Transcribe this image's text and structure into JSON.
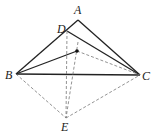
{
  "diagram": {
    "type": "geometry",
    "points": {
      "A": {
        "label": "A",
        "x": 78,
        "y": 20,
        "lx": 74,
        "ly": 14
      },
      "D": {
        "label": "D",
        "x": 67,
        "y": 31,
        "lx": 57,
        "ly": 33
      },
      "I": {
        "label": "",
        "x": 77,
        "y": 51
      },
      "B": {
        "label": "B",
        "x": 16,
        "y": 74,
        "lx": 5,
        "ly": 79
      },
      "C": {
        "label": "C",
        "x": 140,
        "y": 75,
        "lx": 142,
        "ly": 80
      },
      "E": {
        "label": "E",
        "x": 66,
        "y": 118,
        "lx": 61,
        "ly": 131
      }
    },
    "solid_segments": [
      [
        "B",
        "A"
      ],
      [
        "A",
        "C"
      ],
      [
        "D",
        "C"
      ],
      [
        "B",
        "C"
      ],
      [
        "B",
        "I"
      ]
    ],
    "dashed_segments": [
      [
        "I",
        "C"
      ],
      [
        "B",
        "E"
      ],
      [
        "E",
        "C"
      ],
      [
        "D",
        "E"
      ],
      [
        "I",
        "E"
      ]
    ],
    "colors": {
      "line": "#222222",
      "dashed": "#777777"
    }
  }
}
